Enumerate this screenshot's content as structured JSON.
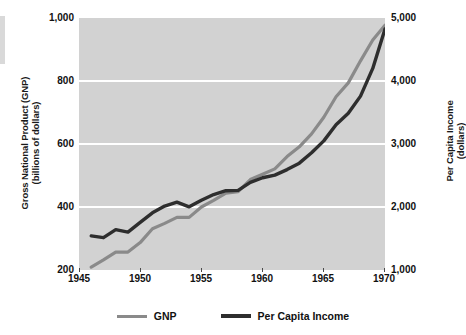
{
  "chart_data": {
    "type": "line",
    "title": "",
    "xlabel": "",
    "ylabel": "Gross National Product (GNP) (billions of dollars)",
    "ylabel_right": "Per Capita Income (dollars)",
    "grid": true,
    "legend_position": "bottom",
    "xlim": [
      1945,
      1970
    ],
    "ylim": [
      200,
      1000
    ],
    "ylim_right": [
      1000,
      5000
    ],
    "xticks": [
      1945,
      1950,
      1955,
      1960,
      1965,
      1970
    ],
    "xticklabels": [
      "1945",
      "1950",
      "1955",
      "1960",
      "1965",
      "1970"
    ],
    "yticks": [
      200,
      400,
      600,
      800,
      1000
    ],
    "yticklabels": [
      "200",
      "400",
      "600",
      "800",
      "1,000"
    ],
    "yticks_right": [
      1000,
      2000,
      3000,
      4000,
      5000
    ],
    "yticklabels_right": [
      "1,000",
      "2,000",
      "3,000",
      "4,000",
      "5,000"
    ],
    "x": [
      1946,
      1947,
      1948,
      1949,
      1950,
      1951,
      1952,
      1953,
      1954,
      1955,
      1956,
      1957,
      1958,
      1959,
      1960,
      1961,
      1962,
      1963,
      1964,
      1965,
      1966,
      1967,
      1968,
      1969,
      1970
    ],
    "series": [
      {
        "name": "GNP",
        "axis": "left",
        "color": "#8a8a8a",
        "units": "billions of dollars",
        "values": [
          209,
          232,
          257,
          257,
          287,
          331,
          348,
          367,
          367,
          400,
          421,
          444,
          449,
          487,
          504,
          521,
          560,
          591,
          632,
          685,
          750,
          794,
          864,
          930,
          977
        ]
      },
      {
        "name": "Per Capita Income",
        "axis": "right",
        "color": "#2e2e2e",
        "units": "dollars",
        "values": [
          1541,
          1513,
          1640,
          1602,
          1755,
          1907,
          2015,
          2076,
          2003,
          2106,
          2198,
          2259,
          2264,
          2391,
          2464,
          2506,
          2594,
          2696,
          2860,
          3050,
          3305,
          3487,
          3760,
          4200,
          4825
        ]
      }
    ]
  },
  "axes": {
    "left_title_line1": "Gross National Product (GNP)",
    "left_title_line2": "(billions of dollars)",
    "right_title_line1": "Per Capita Income",
    "right_title_line2": "(dollars)"
  },
  "legend": {
    "items": [
      {
        "label": "GNP",
        "color": "#8a8a8a"
      },
      {
        "label": "Per Capita Income",
        "color": "#2e2e2e"
      }
    ]
  },
  "colors": {
    "plot_background": "#d2d2d2",
    "gridline": "#ffffff",
    "gnp_line": "#8a8a8a",
    "per_capita_line": "#2e2e2e",
    "text": "#111111",
    "page_background": "#ffffff"
  }
}
